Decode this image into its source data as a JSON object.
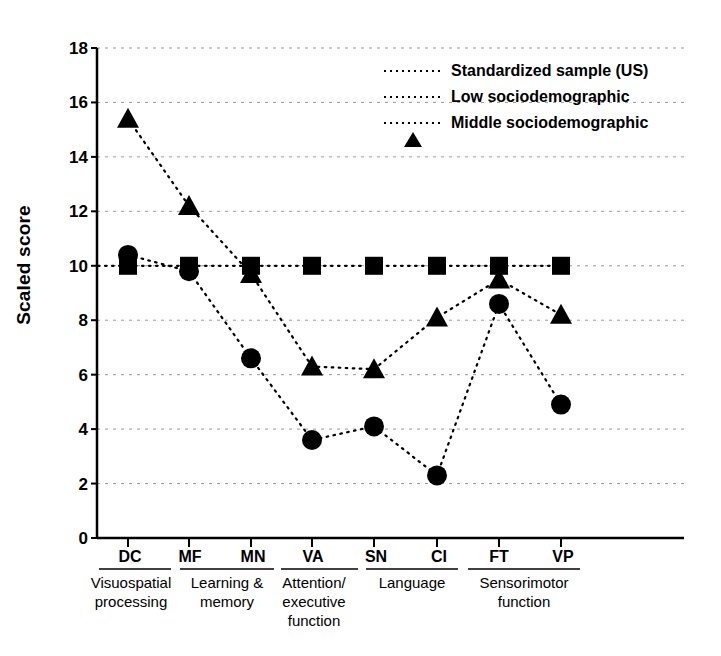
{
  "chart_data": {
    "type": "line",
    "title": "",
    "xlabel": "",
    "ylabel": "Scaled score",
    "ylim": [
      0,
      18
    ],
    "ytick_values": [
      0,
      2,
      4,
      6,
      8,
      10,
      12,
      14,
      16,
      18
    ],
    "grid": "horizontal dotted",
    "legend_position": "top-right inside",
    "categories": [
      "DC",
      "MF",
      "MN",
      "VA",
      "SN",
      "CI",
      "FT",
      "VP"
    ],
    "category_groups": [
      {
        "label": "Visuospatial processing",
        "tests": [
          "DC"
        ]
      },
      {
        "label": "Learning & memory",
        "tests": [
          "MF",
          "MN"
        ]
      },
      {
        "label": "Attention/ executive function",
        "tests": [
          "VA"
        ]
      },
      {
        "label": "Language",
        "tests": [
          "SN",
          "CI"
        ]
      },
      {
        "label": "Sensorimotor function",
        "tests": [
          "FT",
          "VP"
        ]
      }
    ],
    "series": [
      {
        "name": "Standardized sample (US)",
        "marker": "square",
        "values": [
          10.0,
          10.0,
          10.0,
          10.0,
          10.0,
          10.0,
          10.0,
          10.0
        ]
      },
      {
        "name": "Low sociodemographic",
        "marker": "circle",
        "values": [
          10.4,
          9.8,
          6.6,
          3.6,
          4.1,
          2.3,
          8.6,
          4.9
        ]
      },
      {
        "name": "Middle sociodemographic",
        "marker": "triangle",
        "values": [
          15.4,
          12.2,
          9.7,
          6.3,
          6.2,
          8.1,
          9.5,
          8.2
        ]
      }
    ]
  },
  "axis": {
    "y_label": "Scaled score",
    "y_ticks": [
      "18",
      "16",
      "14",
      "12",
      "10",
      "8",
      "6",
      "4",
      "2",
      "0"
    ],
    "x_ticks": [
      "DC",
      "MF",
      "MN",
      "VA",
      "SN",
      "CI",
      "FT",
      "VP"
    ]
  },
  "groups": [
    {
      "label": "Visuospatial\nprocessing"
    },
    {
      "label": "Learning &\nmemory"
    },
    {
      "label": "Attention/\nexecutive\nfunction"
    },
    {
      "label": "Language"
    },
    {
      "label": "Sensorimotor\nfunction"
    }
  ],
  "group_labels": {
    "visuospatial_line1": "Visuospatial",
    "visuospatial_line2": "processing",
    "learning_line1": "Learning &",
    "learning_line2": "memory",
    "attention_line1": "Attention/",
    "attention_line2": "executive",
    "attention_line3": "function",
    "language_line1": "Language",
    "sensorimotor_line1": "Sensorimotor",
    "sensorimotor_line2": "function"
  },
  "legend": {
    "items": [
      {
        "label": "Standardized sample (US)",
        "marker": "square-marker"
      },
      {
        "label": "Low sociodemographic",
        "marker": "circle-marker"
      },
      {
        "label": "Middle sociodemographic",
        "marker": "triangle-marker"
      }
    ]
  },
  "colors": {
    "ink": "#000000",
    "grid": "#9a9a9a",
    "background": "#ffffff"
  }
}
